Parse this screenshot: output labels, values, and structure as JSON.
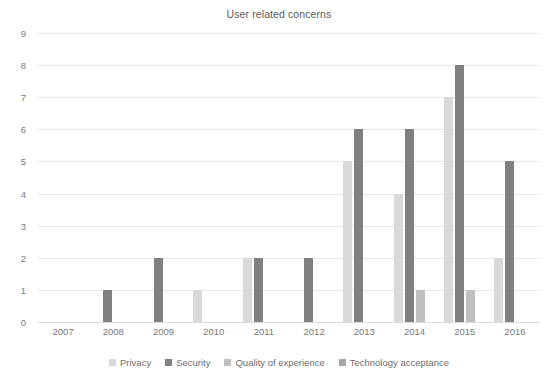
{
  "chart_data": {
    "type": "bar",
    "title": "User related concerns",
    "xlabel": "",
    "ylabel": "",
    "categories": [
      "2007",
      "2008",
      "2009",
      "2010",
      "2011",
      "2012",
      "2013",
      "2014",
      "2015",
      "2016"
    ],
    "series": [
      {
        "name": "Privacy",
        "color": "#d9d9d9",
        "values": [
          0,
          0,
          0,
          1,
          2,
          0,
          5,
          4,
          7,
          2
        ]
      },
      {
        "name": "Security",
        "color": "#808080",
        "values": [
          0,
          1,
          2,
          0,
          2,
          2,
          6,
          6,
          8,
          5
        ]
      },
      {
        "name": "Quality of experience",
        "color": "#bfbfbf",
        "values": [
          0,
          0,
          0,
          0,
          0,
          0,
          0,
          1,
          1,
          0
        ]
      },
      {
        "name": "Technology acceptance",
        "color": "#a6a6a6",
        "values": [
          0,
          0,
          0,
          0,
          0,
          0,
          0,
          0,
          0,
          0
        ]
      }
    ],
    "ylim": [
      0,
      9
    ],
    "y_ticks": [
      "0",
      "1",
      "2",
      "3",
      "4",
      "5",
      "6",
      "7",
      "8",
      "9"
    ],
    "grid": true,
    "legend_position": "bottom",
    "gridline_color": "#e8e8e8",
    "axis_text_color": "#7a7a7a",
    "title_color": "#5a5a5a",
    "background": "#ffffff"
  }
}
